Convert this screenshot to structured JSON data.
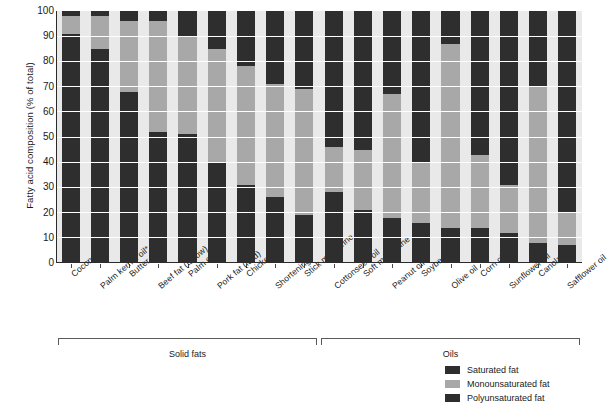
{
  "chart_data": {
    "type": "bar",
    "subtype": "stacked-bar-100",
    "title": "",
    "xlabel": "",
    "ylabel": "Fatty acid composition (% of total)",
    "ylim": [
      0,
      100
    ],
    "ytick_labels": [
      "0",
      "10",
      "20",
      "30",
      "40",
      "50",
      "60",
      "70",
      "80",
      "90",
      "100"
    ],
    "ytick_values": [
      0,
      10,
      20,
      30,
      40,
      50,
      60,
      70,
      80,
      90,
      100
    ],
    "grid": "horizontal",
    "legend_position": "bottom-right",
    "categories": [
      "Coconut oil*",
      "Palm kernel oil*",
      "Butter",
      "Beef fat (tallow)",
      "Palm oil*",
      "Pork fat (lard)",
      "Chicken fat",
      "Shortening",
      "Stick margarine",
      "Cottonseed oil",
      "Soft margarine",
      "Peanut oil",
      "Soybean oil",
      "Olive oil",
      "Corn oil",
      "Sunflower oil",
      "Canola oil",
      "Safflower oil"
    ],
    "series": [
      {
        "name": "Saturated fat",
        "color": "#2e2e2e",
        "values": [
          91,
          85,
          68,
          52,
          51,
          40,
          31,
          26,
          19,
          28,
          21,
          18,
          16,
          14,
          14,
          12,
          8,
          7
        ]
      },
      {
        "name": "Monounsaturated fat",
        "color": "#a8a8a8",
        "values": [
          7,
          13,
          28,
          44,
          39,
          45,
          47,
          45,
          50,
          18,
          24,
          49,
          24,
          73,
          29,
          19,
          62,
          13
        ]
      },
      {
        "name": "Polyunsaturated fat",
        "color": "#2e2e2e",
        "values": [
          2,
          2,
          4,
          4,
          10,
          15,
          22,
          29,
          31,
          54,
          55,
          33,
          60,
          13,
          57,
          69,
          30,
          80
        ]
      }
    ],
    "groups": [
      {
        "label": "Solid fats",
        "start_index": 0,
        "end_index": 8
      },
      {
        "label": "Oils",
        "start_index": 9,
        "end_index": 17
      }
    ]
  },
  "legend": {
    "items": [
      {
        "label": "Saturated fat",
        "swatch": "#2e2e2e"
      },
      {
        "label": "Monounsaturated fat",
        "swatch": "#a8a8a8"
      },
      {
        "label": "Polyunsaturated fat",
        "swatch": "#2e2e2e"
      }
    ]
  },
  "colors": {
    "saturated": "#2e2e2e",
    "monounsaturated": "#a8a8a8",
    "polyunsaturated": "#2e2e2e",
    "plot_background": "#e9e9e9",
    "gridline": "#ffffff",
    "axis": "#2b2b2b"
  }
}
